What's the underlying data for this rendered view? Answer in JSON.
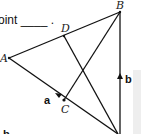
{
  "diagram": {
    "prompt_fragment": "oint ____ .",
    "points": {
      "A": {
        "label": "A",
        "x": 9,
        "y": 58
      },
      "B": {
        "label": "B",
        "x": 120,
        "y": 12
      },
      "C": {
        "label": "C",
        "x": 64,
        "y": 100
      },
      "D": {
        "label": "D",
        "x": 64,
        "y": 36
      },
      "E": {
        "label": "",
        "x": 118,
        "y": 134
      }
    },
    "vectors": {
      "a": {
        "label": "a"
      },
      "b": {
        "label": "b"
      }
    },
    "bottom_label": "b",
    "colors": {
      "line": "#111111",
      "panel": "#eeeeee"
    }
  }
}
